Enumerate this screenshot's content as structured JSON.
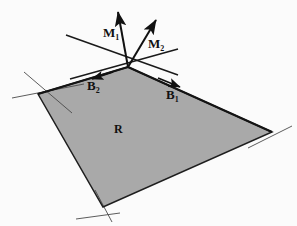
{
  "figure": {
    "background_color": "#fbfbfb",
    "region_fill_color": "#a9a9a9",
    "line_color": "#1a1a1a",
    "thin_line_color": "#3a3a3a"
  },
  "labels": {
    "region": {
      "text": "R",
      "sub": "",
      "x": 118,
      "y": 129
    },
    "m1": {
      "text": "M",
      "sub": "1",
      "x": 106,
      "y": 35
    },
    "m2": {
      "text": "M",
      "sub": "2",
      "x": 151,
      "y": 46
    },
    "b1": {
      "text": "B",
      "sub": "1",
      "x": 168,
      "y": 95
    },
    "b2": {
      "text": "B",
      "sub": "2",
      "x": 90,
      "y": 86
    }
  },
  "geometry": {
    "region_vertices": "128,67 38,94 103,207 272,132",
    "apex": {
      "x": 128,
      "y": 67
    },
    "vertex_left": {
      "x": 38,
      "y": 94
    },
    "vertex_bottom": {
      "x": 103,
      "y": 207
    },
    "vertex_right": {
      "x": 272,
      "y": 132
    },
    "vector_m1": {
      "x1": 128,
      "y1": 67,
      "x2": 117,
      "y2": 8
    },
    "vector_m2": {
      "x1": 128,
      "y1": 67,
      "x2": 157,
      "y2": 16
    },
    "tangent_line_1": {
      "x1": 68,
      "y1": 36,
      "x2": 176,
      "y2": 74
    },
    "tangent_line_2": {
      "x1": 72,
      "y1": 78,
      "x2": 176,
      "y2": 50
    },
    "edge_line_left_ext": {
      "x1": 24,
      "y1": 72,
      "x2": 66,
      "y2": 108
    },
    "edge_line_left_cross": {
      "x1": 14,
      "y1": 97,
      "x2": 78,
      "y2": 85
    },
    "edge_line_bottom_ext": {
      "x1": 78,
      "y1": 217,
      "x2": 118,
      "y2": 212
    },
    "edge_line_right_ext": {
      "x1": 252,
      "y1": 146,
      "x2": 290,
      "y2": 128
    },
    "arrow_b2": {
      "x1": 112,
      "y1": 73,
      "x2": 94,
      "y2": 79
    },
    "arrow_b1": {
      "x1": 160,
      "y1": 78,
      "x2": 178,
      "y2": 86
    }
  }
}
